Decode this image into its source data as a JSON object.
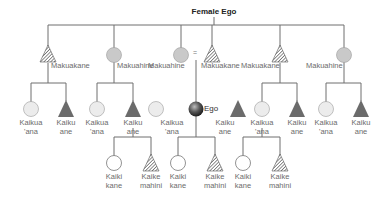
{
  "title": "Female Ego",
  "equals_sign": "=",
  "colors": {
    "line": "#6e6e6e",
    "circle_fill_parent": "#c9c9c9",
    "circle_fill_sibling": "#ececec",
    "triangle_fill": "#6b6b6b",
    "hatch": "#555555",
    "ego_fill": "#444444"
  },
  "parents": [
    {
      "label": "Makuakane",
      "shape": "triangle-hatched"
    },
    {
      "label": "Makuahine",
      "shape": "circle"
    },
    {
      "label": "Makuahine",
      "shape": "circle"
    },
    {
      "label": "Makuakane",
      "shape": "triangle-hatched"
    },
    {
      "label": "Makuakane",
      "shape": "triangle-hatched"
    },
    {
      "label": "Makuahine",
      "shape": "circle"
    }
  ],
  "siblings": [
    {
      "label": "Kaikua\n'ana",
      "shape": "circle"
    },
    {
      "label": "Kaiku\nane",
      "shape": "triangle"
    },
    {
      "label": "Kaikua\n'ana",
      "shape": "circle"
    },
    {
      "label": "Kaiku\nane",
      "shape": "triangle"
    },
    {
      "label": "Kaikua\n'ana",
      "shape": "circle"
    },
    {
      "label": "Ego",
      "shape": "ego"
    },
    {
      "label": "Kaiku\nane",
      "shape": "triangle"
    },
    {
      "label": "Kaikua\n'ana",
      "shape": "circle"
    },
    {
      "label": "Kaiku\nane",
      "shape": "triangle"
    },
    {
      "label": "Kaikua\n'ana",
      "shape": "circle"
    },
    {
      "label": "Kaiku\nane",
      "shape": "triangle"
    }
  ],
  "children": [
    {
      "label": "Kaiki\nkane",
      "shape": "circle-open"
    },
    {
      "label": "Kaike\nmahini",
      "shape": "triangle-hatched"
    },
    {
      "label": "Kaiki\nkane",
      "shape": "circle-open"
    },
    {
      "label": "Kaike\nmahini",
      "shape": "triangle-hatched"
    },
    {
      "label": "Kaiki\nkane",
      "shape": "circle-open"
    },
    {
      "label": "Kaike\nmahini",
      "shape": "triangle-hatched"
    }
  ]
}
